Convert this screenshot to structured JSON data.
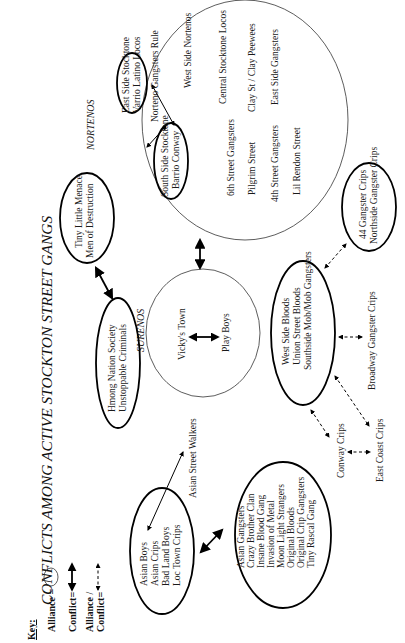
{
  "title": "CONFLICTS AMONG ACTIVE STOCKTON STREET GANGS",
  "key": {
    "heading": "Key:",
    "alliance_label": "Alliance =",
    "conflict_label": "Conflict=",
    "alliance_conflict_label_1": "Alliance /",
    "alliance_conflict_label_2": "Conflict="
  },
  "groups": {
    "nortenos": {
      "label": "NORTENOS",
      "east_side": [
        "East Side Stocktone",
        "Varrio Latino Locos"
      ],
      "south_side": [
        "South Side Stocktone",
        "Barrio Conway"
      ],
      "gangs": [
        "Norteno Gangsters Rule",
        "West Side Nortenos",
        "Central Stocktone Locos",
        "Clay St / Clay Peewees",
        "East Side Gangsters",
        "6th Street Gangsters",
        "Pilgrim Street",
        "4th Street Gangsters",
        "Lil Rendon Street"
      ]
    },
    "surenos": {
      "label": "SURENOS",
      "gangs": [
        "Vicky's Town",
        "Play Boys"
      ]
    },
    "tiny_little_menace": [
      "Tiny Little Menace",
      "Men of Destruction"
    ],
    "hmong": [
      "Hmong Nation Society",
      "Unstoppable Criminals"
    ],
    "asian_street_walkers": "Asian Street Walkers",
    "asian_boys": [
      "Asian Boys",
      "Asian Crips",
      "Bad Land Boys",
      "Loc Town Crips"
    ],
    "asian_gangsters": [
      "Asian Gangsters",
      "Crazy Brother Clan",
      "Insane Blood Gang",
      "Invasion of Metal",
      "Moon Light Strangers",
      "Original Bloods",
      "Original Crip Gangsters",
      "Tiny Rascal Gang"
    ],
    "bloods": [
      "West Side Bloods",
      "Union Street Bloods",
      "Southside Mob/Mob Gangsters"
    ],
    "crips_44": [
      "44 Gangster Crips",
      "Northside Gangster Crips"
    ],
    "broadway": "Broadway Gangster Crips",
    "conway_crips": "Conway Crips",
    "east_coast_crips": "East Coast Crips"
  }
}
